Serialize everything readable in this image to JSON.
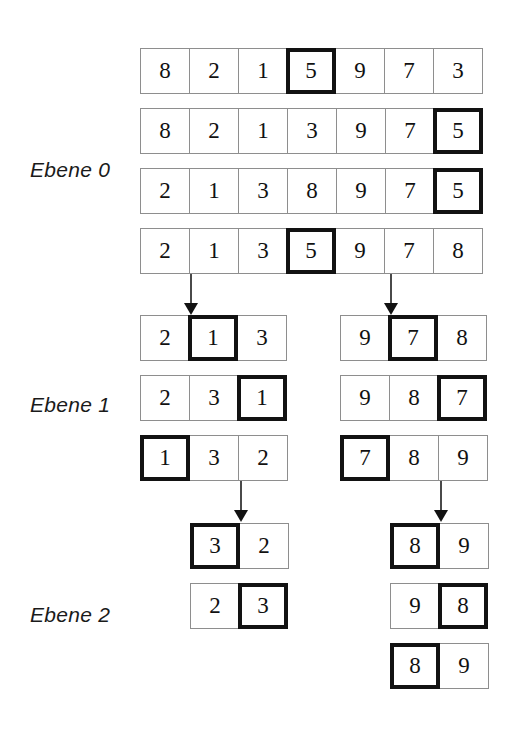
{
  "figure": {
    "language": "de",
    "background_color": "#ffffff",
    "cell_border_color": "#8e8e8e",
    "highlight_color": "#121212",
    "arrow_color": "#4a4a4a"
  },
  "labels": [
    {
      "id": "ebene-0",
      "text": "Ebene 0",
      "x": 30,
      "y": 158
    },
    {
      "id": "ebene-1",
      "text": "Ebene 1",
      "x": 30,
      "y": 393
    },
    {
      "id": "ebene-2",
      "text": "Ebene 2",
      "x": 30,
      "y": 603
    }
  ],
  "levels": [
    {
      "id": "level-0",
      "label": "Ebene 0",
      "groups": [
        {
          "id": "level-0-group-0",
          "x": 140,
          "rows": [
            {
              "id": "l0-r0",
              "y": 48,
              "x": 140,
              "values": [
                "8",
                "2",
                "1",
                "5",
                "9",
                "7",
                "3"
              ],
              "highlight": [
                3
              ]
            },
            {
              "id": "l0-r1",
              "y": 108,
              "x": 140,
              "values": [
                "8",
                "2",
                "1",
                "3",
                "9",
                "7",
                "5"
              ],
              "highlight": [
                6
              ]
            },
            {
              "id": "l0-r2",
              "y": 168,
              "x": 140,
              "values": [
                "2",
                "1",
                "3",
                "8",
                "9",
                "7",
                "5"
              ],
              "highlight": [
                6
              ]
            },
            {
              "id": "l0-r3",
              "y": 228,
              "x": 140,
              "values": [
                "2",
                "1",
                "3",
                "5",
                "9",
                "7",
                "8"
              ],
              "highlight": [
                3
              ]
            }
          ]
        }
      ]
    },
    {
      "id": "level-1",
      "label": "Ebene 1",
      "groups": [
        {
          "id": "level-1-group-left",
          "x": 140,
          "rows": [
            {
              "id": "l1a-r0",
              "y": 315,
              "x": 140,
              "values": [
                "2",
                "1",
                "3"
              ],
              "highlight": [
                1
              ]
            },
            {
              "id": "l1a-r1",
              "y": 375,
              "x": 140,
              "values": [
                "2",
                "3",
                "1"
              ],
              "highlight": [
                2
              ]
            },
            {
              "id": "l1a-r2",
              "y": 435,
              "x": 140,
              "values": [
                "1",
                "3",
                "2"
              ],
              "highlight": [
                0
              ]
            }
          ]
        },
        {
          "id": "level-1-group-right",
          "x": 340,
          "rows": [
            {
              "id": "l1b-r0",
              "y": 315,
              "x": 340,
              "values": [
                "9",
                "7",
                "8"
              ],
              "highlight": [
                1
              ]
            },
            {
              "id": "l1b-r1",
              "y": 375,
              "x": 340,
              "values": [
                "9",
                "8",
                "7"
              ],
              "highlight": [
                2
              ]
            },
            {
              "id": "l1b-r2",
              "y": 435,
              "x": 340,
              "values": [
                "7",
                "8",
                "9"
              ],
              "highlight": [
                0
              ]
            }
          ]
        }
      ]
    },
    {
      "id": "level-2",
      "label": "Ebene 2",
      "groups": [
        {
          "id": "level-2-group-left",
          "x": 190,
          "rows": [
            {
              "id": "l2a-r0",
              "y": 523,
              "x": 190,
              "values": [
                "3",
                "2"
              ],
              "highlight": [
                0
              ]
            },
            {
              "id": "l2a-r1",
              "y": 583,
              "x": 190,
              "values": [
                "2",
                "3"
              ],
              "highlight": [
                1
              ]
            }
          ]
        },
        {
          "id": "level-2-group-right",
          "x": 390,
          "rows": [
            {
              "id": "l2b-r0",
              "y": 523,
              "x": 390,
              "values": [
                "8",
                "9"
              ],
              "highlight": [
                0
              ]
            },
            {
              "id": "l2b-r1",
              "y": 583,
              "x": 390,
              "values": [
                "9",
                "8"
              ],
              "highlight": [
                1
              ]
            },
            {
              "id": "l2b-r2",
              "y": 643,
              "x": 390,
              "values": [
                "8",
                "9"
              ],
              "highlight": [
                0
              ]
            }
          ]
        }
      ]
    }
  ],
  "arrows": [
    {
      "id": "arrow-0-to-1-left",
      "x": 190,
      "y": 274,
      "height": 30
    },
    {
      "id": "arrow-0-to-1-right",
      "x": 390,
      "y": 274,
      "height": 30
    },
    {
      "id": "arrow-1-to-2-left",
      "x": 240,
      "y": 481,
      "height": 30
    },
    {
      "id": "arrow-1-to-2-right",
      "x": 440,
      "y": 481,
      "height": 30
    }
  ]
}
